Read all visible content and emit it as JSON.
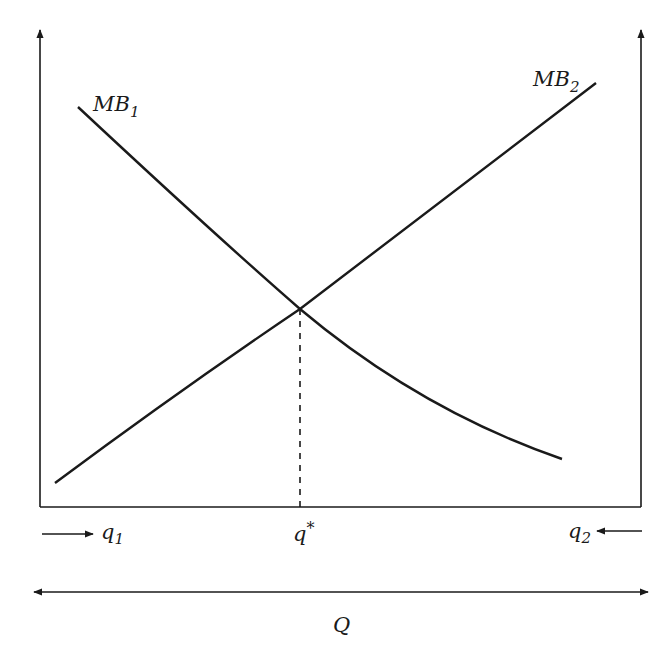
{
  "diagram": {
    "type": "economics-marginal-benefit",
    "curves": [
      {
        "name": "MB1",
        "label_main": "MB",
        "label_sub": "1",
        "direction": "downward-sloping, convex"
      },
      {
        "name": "MB2",
        "label_main": "MB",
        "label_sub": "2",
        "direction": "upward-sloping"
      }
    ],
    "intersection": {
      "label_main": "q",
      "label_sup": "*"
    },
    "markers": {
      "q1": {
        "label_main": "q",
        "label_sub": "1",
        "arrow": "from left pointing right"
      },
      "q2": {
        "label_main": "q",
        "label_sub": "2",
        "arrow": "from right pointing left"
      }
    },
    "total_axis": {
      "label": "Q",
      "arrow": "double-headed"
    },
    "colors": {
      "line": "#1a1a1a",
      "background": "#ffffff"
    }
  }
}
